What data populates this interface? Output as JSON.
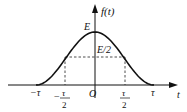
{
  "figure": {
    "y_axis_label": "f(t)",
    "x_axis_label": "t",
    "peak_label": "E",
    "half_label": "E/2",
    "origin_label": "O",
    "ticks": {
      "neg_tau": "−τ",
      "neg_half_tau_sign": "−",
      "half_tau_num": "τ",
      "half_tau_den": "2",
      "tau": "τ"
    },
    "colors": {
      "curve": "#111111",
      "axis": "#111111",
      "dashed": "#222222",
      "background": "#ffffff"
    }
  }
}
